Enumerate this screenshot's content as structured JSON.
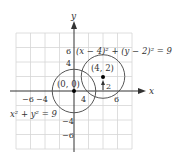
{
  "diagram": {
    "axes": {
      "x_label": "x",
      "y_label": "y"
    },
    "x_ticks": [
      {
        "value": -6,
        "label": "−6"
      },
      {
        "value": -4,
        "label": "−4"
      },
      {
        "value": 4,
        "label": "4"
      },
      {
        "value": 6,
        "label": "6"
      }
    ],
    "y_ticks": [
      {
        "value": 6,
        "label": "6"
      },
      {
        "value": 4,
        "label": "4"
      },
      {
        "value": -4,
        "label": "−4"
      },
      {
        "value": -6,
        "label": "−6"
      }
    ],
    "grid": {
      "min": -8,
      "max": 8,
      "step": 2
    },
    "circles": [
      {
        "center": [
          0,
          0
        ],
        "radius": 3,
        "center_label": "(0, 0)",
        "equation": "x² + y² = 9"
      },
      {
        "center": [
          4,
          2
        ],
        "radius": 3,
        "center_label": "(4, 2)",
        "equation": "(x − 4)² + (y − 2)² = 9"
      }
    ],
    "arrow_label": "2",
    "colors": {
      "grid": "#d4d4d4",
      "axis": "#333333",
      "circle": "#555555",
      "point": "#000000"
    }
  }
}
